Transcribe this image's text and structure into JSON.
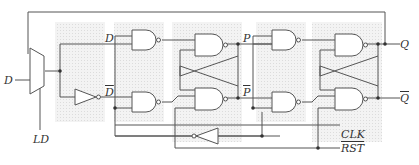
{
  "diagram": {
    "labels": {
      "d_in": "D",
      "ld": "LD",
      "d_int": "D",
      "dbar_int": "D",
      "p": "P",
      "pbar": "P",
      "q": "Q",
      "qbar": "Q",
      "clk": "CLK",
      "rst": "RST"
    },
    "overbar_labels": [
      "dbar_int",
      "pbar",
      "qbar",
      "rst"
    ],
    "components": [
      {
        "type": "mux",
        "name": "load-mux"
      },
      {
        "type": "not",
        "name": "d-inverter"
      },
      {
        "type": "nand",
        "name": "master-input-nand-top"
      },
      {
        "type": "nand",
        "name": "master-input-nand-bottom"
      },
      {
        "type": "nand",
        "name": "master-latch-nand-top"
      },
      {
        "type": "nand",
        "name": "master-latch-nand-bottom"
      },
      {
        "type": "nand",
        "name": "slave-input-nand-top"
      },
      {
        "type": "nand",
        "name": "slave-input-nand-bottom"
      },
      {
        "type": "nand",
        "name": "slave-latch-nand-top"
      },
      {
        "type": "nand",
        "name": "slave-latch-nand-bottom"
      },
      {
        "type": "not",
        "name": "clk-inverter"
      }
    ],
    "colors": {
      "wire": "#555555",
      "block_bg": "#e9e9e9",
      "gate_fill": "#ffffff"
    }
  }
}
